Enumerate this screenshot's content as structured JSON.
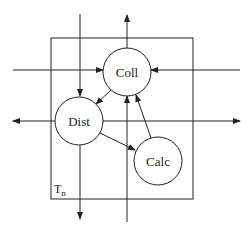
{
  "diagram": {
    "type": "process-network",
    "box": {
      "label": "T",
      "subscript": "n"
    },
    "nodes": [
      {
        "id": "coll",
        "label": "Coll"
      },
      {
        "id": "dist",
        "label": "Dist"
      },
      {
        "id": "calc",
        "label": "Calc"
      }
    ],
    "edges": [
      {
        "from": "coll",
        "to": "dist"
      },
      {
        "from": "dist",
        "to": "calc"
      },
      {
        "from": "calc",
        "to": "coll"
      },
      {
        "from": "external-left",
        "to": "coll"
      },
      {
        "from": "external-right",
        "to": "coll"
      },
      {
        "from": "external-bottom",
        "to": "coll"
      },
      {
        "from": "coll",
        "to": "external-top"
      },
      {
        "from": "external-top",
        "to": "dist"
      },
      {
        "from": "dist",
        "to": "external-left"
      },
      {
        "from": "dist",
        "to": "external-right"
      },
      {
        "from": "dist",
        "to": "external-bottom"
      }
    ],
    "colors": {
      "stroke": "#222222",
      "background": "#ffffff"
    }
  }
}
